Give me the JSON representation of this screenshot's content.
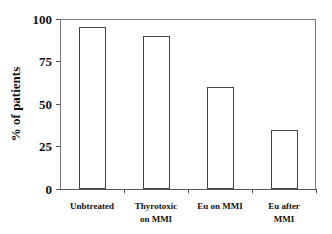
{
  "chart_data": {
    "type": "bar",
    "title": "",
    "xlabel": "",
    "ylabel": "% of patients",
    "ylim": [
      0,
      100
    ],
    "yticks": [
      "0",
      "25",
      "50",
      "75",
      "100"
    ],
    "categories": [
      "Unbtreated",
      "Thyrotoxic on MMI",
      "Eu on MMI",
      "Eu after MMI"
    ],
    "category_lines": [
      [
        "Unbtreated"
      ],
      [
        "Thyrotoxic",
        "on MMI"
      ],
      [
        "Eu on MMI"
      ],
      [
        "Eu after",
        "MMI"
      ]
    ],
    "values": [
      95,
      90,
      60,
      35
    ],
    "bar_fill": "#ffffff",
    "bar_edge": "#444444",
    "grid": false,
    "legend": null
  }
}
